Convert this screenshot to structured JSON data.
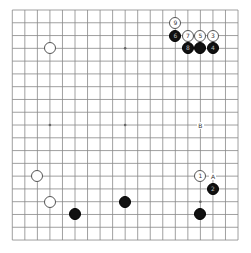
{
  "board": {
    "size": 19,
    "origin_x": 12.3,
    "origin_y": 10,
    "spacing_x": 12.54,
    "spacing_y": 12.78,
    "line_color": "#888888",
    "star_points": [
      [
        3,
        3
      ],
      [
        3,
        9
      ],
      [
        3,
        15
      ],
      [
        9,
        3
      ],
      [
        9,
        9
      ],
      [
        9,
        15
      ],
      [
        15,
        3
      ],
      [
        15,
        9
      ],
      [
        15,
        15
      ]
    ]
  },
  "stones": [
    {
      "color": "white",
      "col": 3,
      "row": 3,
      "label": ""
    },
    {
      "color": "white",
      "col": 2,
      "row": 13,
      "label": ""
    },
    {
      "color": "white",
      "col": 3,
      "row": 15,
      "label": ""
    },
    {
      "color": "black",
      "col": 5,
      "row": 16,
      "label": ""
    },
    {
      "color": "black",
      "col": 9,
      "row": 15,
      "label": ""
    },
    {
      "color": "black",
      "col": 15,
      "row": 16,
      "label": ""
    },
    {
      "color": "white",
      "col": 15,
      "row": 13,
      "label": "1"
    },
    {
      "color": "black",
      "col": 16,
      "row": 14,
      "label": "2"
    },
    {
      "color": "white",
      "col": 16,
      "row": 2,
      "label": "3"
    },
    {
      "color": "black",
      "col": 16,
      "row": 3,
      "label": "4"
    },
    {
      "color": "white",
      "col": 15,
      "row": 2,
      "label": "5"
    },
    {
      "color": "black",
      "col": 13,
      "row": 2,
      "label": "6"
    },
    {
      "color": "white",
      "col": 14,
      "row": 2,
      "label": "7"
    },
    {
      "color": "black",
      "col": 14,
      "row": 3,
      "label": "8"
    },
    {
      "color": "black",
      "col": 15,
      "row": 3,
      "label": ""
    },
    {
      "color": "white",
      "col": 13,
      "row": 1,
      "label": "9"
    }
  ],
  "markers": [
    {
      "text": "A",
      "col": 16,
      "row": 13
    },
    {
      "text": "B",
      "col": 15,
      "row": 9
    }
  ]
}
